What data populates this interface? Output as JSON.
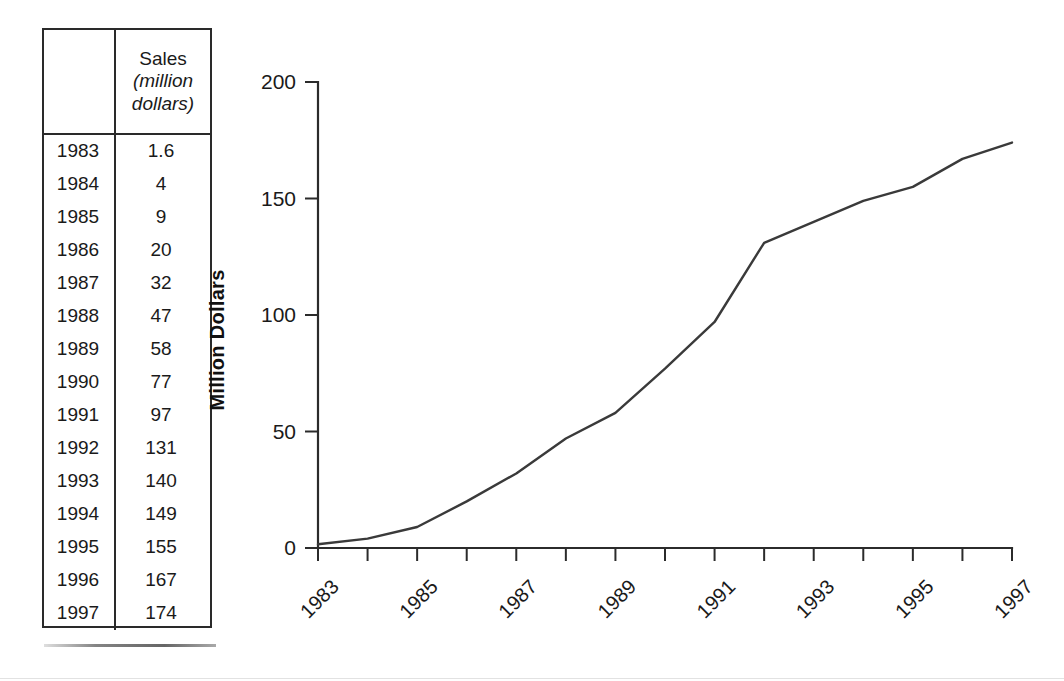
{
  "table": {
    "columns": [
      "",
      "Sales (million dollars)"
    ],
    "header": {
      "year_label": "",
      "sales_label": "Sales",
      "sales_unit_line1": "(million",
      "sales_unit_line2": "dollars)"
    },
    "rows": [
      {
        "year": "1983",
        "value": "1.6"
      },
      {
        "year": "1984",
        "value": "4"
      },
      {
        "year": "1985",
        "value": "9"
      },
      {
        "year": "1986",
        "value": "20"
      },
      {
        "year": "1987",
        "value": "32"
      },
      {
        "year": "1988",
        "value": "47"
      },
      {
        "year": "1989",
        "value": "58"
      },
      {
        "year": "1990",
        "value": "77"
      },
      {
        "year": "1991",
        "value": "97"
      },
      {
        "year": "1992",
        "value": "131"
      },
      {
        "year": "1993",
        "value": "140"
      },
      {
        "year": "1994",
        "value": "149"
      },
      {
        "year": "1995",
        "value": "155"
      },
      {
        "year": "1996",
        "value": "167"
      },
      {
        "year": "1997",
        "value": "174"
      }
    ]
  },
  "chart_data": {
    "type": "line",
    "title": "",
    "xlabel": "",
    "ylabel": "Million Dollars",
    "x": [
      1983,
      1984,
      1985,
      1986,
      1987,
      1988,
      1989,
      1990,
      1991,
      1992,
      1993,
      1994,
      1995,
      1996,
      1997
    ],
    "values": [
      1.6,
      4,
      9,
      20,
      32,
      47,
      58,
      77,
      97,
      131,
      140,
      149,
      155,
      167,
      174
    ],
    "series": [
      {
        "name": "Sales",
        "values": [
          1.6,
          4,
          9,
          20,
          32,
          47,
          58,
          77,
          97,
          131,
          140,
          149,
          155,
          167,
          174
        ]
      }
    ],
    "xlim": [
      1983,
      1997
    ],
    "ylim": [
      0,
      200
    ],
    "yticks": [
      0,
      50,
      100,
      150,
      200
    ],
    "ytick_labels": [
      "0",
      "50",
      "100",
      "150",
      "200"
    ],
    "xticks": [
      1983,
      1984,
      1985,
      1986,
      1987,
      1988,
      1989,
      1990,
      1991,
      1992,
      1993,
      1994,
      1995,
      1996,
      1997
    ],
    "xtick_labels_shown": [
      "1983",
      "1985",
      "1987",
      "1989",
      "1991",
      "1993",
      "1995",
      "1997"
    ],
    "xtick_label_rotation": -45,
    "grid": false,
    "legend": false,
    "line_color": "#3a3a3a",
    "axis_color": "#2b2b2b"
  }
}
